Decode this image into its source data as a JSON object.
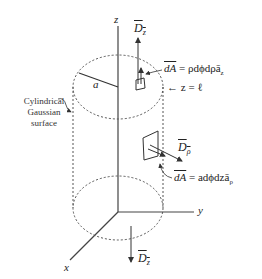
{
  "diagram": {
    "axes": {
      "z": "z",
      "y": "y",
      "x": "x"
    },
    "radius_label": "a",
    "surface_label": [
      "Cylindrical",
      "Gaussian",
      "surface"
    ],
    "top": {
      "flux_label_base": "D",
      "flux_label_sub": "z",
      "dA_label": "dA",
      "dA_expr": " = ρdϕdρā",
      "dA_sub": "z",
      "plane_label": "← z = ℓ"
    },
    "side": {
      "flux_label_base": "D",
      "flux_label_sub": "ρ",
      "dA_label": "dA",
      "dA_expr": " = adϕdzā",
      "dA_sub": "ρ"
    },
    "bottom": {
      "flux_label_base": "D",
      "flux_label_sub": "z"
    },
    "colors": {
      "line": "#333333",
      "dotted": "#555555"
    }
  }
}
